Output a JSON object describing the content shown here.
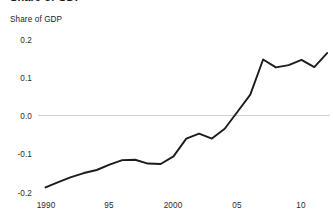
{
  "figure": {
    "clipped_title": "Share of GDP",
    "axis_title": "Share of GDP"
  },
  "chart_data": {
    "type": "line",
    "title": "",
    "subtitle": "",
    "xlabel": "",
    "ylabel": "Share of GDP",
    "xlim": [
      1989.6,
      2012.2
    ],
    "ylim": [
      -0.215,
      0.225
    ],
    "grid": false,
    "zero_line": true,
    "legend": null,
    "x_ticks": [
      1990,
      1995,
      2000,
      2005,
      2010
    ],
    "x_tick_labels": [
      "1990",
      "95",
      "2000",
      "05",
      "10"
    ],
    "y_ticks": [
      -0.2,
      -0.1,
      0.0,
      0.1,
      0.2
    ],
    "y_tick_labels": [
      "-0.2",
      "-0.1",
      "0.0",
      "0.1",
      "0.2"
    ],
    "line_color": "#1c1c1c",
    "series": [
      {
        "name": "Share of GDP",
        "x": [
          1990,
          1991,
          1992,
          1993,
          1994,
          1995,
          1996,
          1997,
          1998,
          1999,
          2000,
          2001,
          2002,
          2003,
          2004,
          2005,
          2006,
          2007,
          2008,
          2009,
          2010,
          2011,
          2012
        ],
        "values": [
          -0.19,
          -0.176,
          -0.163,
          -0.152,
          -0.144,
          -0.13,
          -0.118,
          -0.117,
          -0.127,
          -0.128,
          -0.108,
          -0.061,
          -0.048,
          -0.061,
          -0.035,
          0.01,
          0.055,
          0.148,
          0.127,
          0.133,
          0.147,
          0.128,
          0.165
        ]
      }
    ]
  }
}
